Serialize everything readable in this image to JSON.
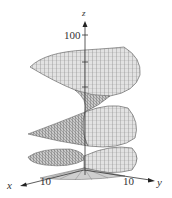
{
  "figure": {
    "type": "3d-surface-plot",
    "colors": {
      "surface": "#d8d8d8",
      "mesh": "#555555",
      "axis": "#333333",
      "background": "#ffffff"
    }
  },
  "axes": {
    "z": {
      "label": "z",
      "tick": "100"
    },
    "x": {
      "label": "x",
      "tick": "10"
    },
    "y": {
      "label": "y",
      "tick": "10"
    }
  }
}
